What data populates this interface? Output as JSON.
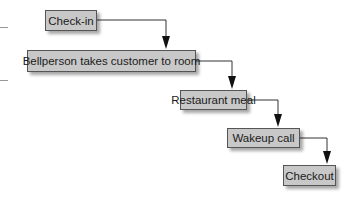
{
  "diagram": {
    "type": "flowchart-steps",
    "steps": [
      {
        "id": "checkin",
        "label": "Check-in"
      },
      {
        "id": "bellperson",
        "label": "Bellperson takes customer to room"
      },
      {
        "id": "restaurant",
        "label": "Restaurant meal"
      },
      {
        "id": "wakeup",
        "label": "Wakeup call"
      },
      {
        "id": "checkout",
        "label": "Checkout"
      }
    ],
    "edges": [
      {
        "from": "checkin",
        "to": "bellperson"
      },
      {
        "from": "bellperson",
        "to": "restaurant"
      },
      {
        "from": "restaurant",
        "to": "wakeup"
      },
      {
        "from": "wakeup",
        "to": "checkout"
      }
    ],
    "colors": {
      "box_fill": "#c8c8c8",
      "box_border": "#555555",
      "line": "#333333"
    }
  }
}
